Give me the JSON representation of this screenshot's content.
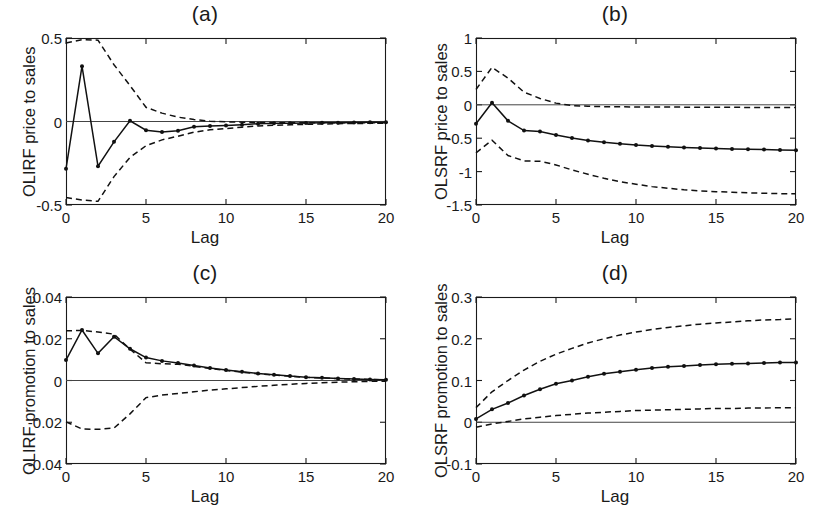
{
  "figure": {
    "panels": [
      {
        "id": "a",
        "title": "(a)",
        "ylabel": "OLIRF price to sales",
        "xlabel": "Lag",
        "yticks": [
          "0.5",
          "0",
          "-0.5"
        ],
        "xticks": [
          "0",
          "5",
          "10",
          "15",
          "20"
        ]
      },
      {
        "id": "b",
        "title": "(b)",
        "ylabel": "OLSRF price to sales",
        "xlabel": "Lag",
        "yticks": [
          "1",
          "0.5",
          "0",
          "-0.5",
          "-1",
          "-1.5"
        ],
        "xticks": [
          "0",
          "5",
          "10",
          "15",
          "20"
        ]
      },
      {
        "id": "c",
        "title": "(c)",
        "ylabel": "OLIRF promotion to sales",
        "xlabel": "Lag",
        "yticks": [
          "0.04",
          "0.02",
          "0",
          "-0.02",
          "-0.04"
        ],
        "xticks": [
          "0",
          "5",
          "10",
          "15",
          "20"
        ]
      },
      {
        "id": "d",
        "title": "(d)",
        "ylabel": "OLSRF promotion to sales",
        "xlabel": "Lag",
        "yticks": [
          "0.3",
          "0.2",
          "0.1",
          "0",
          "-0.1"
        ],
        "xticks": [
          "0",
          "5",
          "10",
          "15",
          "20"
        ]
      }
    ]
  },
  "chart_data": [
    {
      "type": "line",
      "title": "(a)",
      "xlabel": "Lag",
      "ylabel": "OLIRF price to sales",
      "xlim": [
        0,
        20
      ],
      "ylim": [
        -0.5,
        0.5
      ],
      "yticks": [
        -0.5,
        0,
        0.5
      ],
      "xticks": [
        0,
        5,
        10,
        15,
        20
      ],
      "grid": false,
      "legend": "none",
      "zero_line": true,
      "x": [
        0,
        1,
        2,
        3,
        4,
        5,
        6,
        7,
        8,
        9,
        10,
        11,
        12,
        13,
        14,
        15,
        16,
        17,
        18,
        19,
        20
      ],
      "series": [
        {
          "name": "orthogonalized impulse response",
          "style": "solid-with-markers",
          "values": [
            -0.283,
            0.331,
            -0.268,
            -0.122,
            0.004,
            -0.052,
            -0.063,
            -0.055,
            -0.032,
            -0.027,
            -0.024,
            -0.019,
            -0.013,
            -0.011,
            -0.011,
            -0.009,
            -0.008,
            -0.007,
            -0.006,
            -0.005,
            -0.005
          ]
        },
        {
          "name": "upper 95% confidence band",
          "style": "dashed",
          "values": [
            0.47,
            0.49,
            0.487,
            0.34,
            0.215,
            0.085,
            0.05,
            0.026,
            0.012,
            0.002,
            -0.002,
            -0.004,
            -0.006,
            -0.007,
            -0.008,
            -0.008,
            -0.008,
            -0.008,
            -0.008,
            -0.008,
            -0.008
          ]
        },
        {
          "name": "lower 95% confidence band",
          "style": "dashed",
          "values": [
            -0.455,
            -0.47,
            -0.478,
            -0.33,
            -0.215,
            -0.145,
            -0.11,
            -0.088,
            -0.064,
            -0.05,
            -0.042,
            -0.034,
            -0.027,
            -0.023,
            -0.02,
            -0.017,
            -0.015,
            -0.013,
            -0.012,
            -0.011,
            -0.01
          ]
        }
      ]
    },
    {
      "type": "line",
      "title": "(b)",
      "xlabel": "Lag",
      "ylabel": "OLSRF price to sales",
      "xlim": [
        0,
        20
      ],
      "ylim": [
        -1.5,
        1.0
      ],
      "yticks": [
        -1.5,
        -1,
        -0.5,
        0,
        0.5,
        1
      ],
      "xticks": [
        0,
        5,
        10,
        15,
        20
      ],
      "grid": false,
      "legend": "none",
      "zero_line": true,
      "x": [
        0,
        1,
        2,
        3,
        4,
        5,
        6,
        7,
        8,
        9,
        10,
        11,
        12,
        13,
        14,
        15,
        16,
        17,
        18,
        19,
        20
      ],
      "series": [
        {
          "name": "orthogonalized cumulative response",
          "style": "solid-with-markers",
          "values": [
            -0.283,
            0.03,
            -0.24,
            -0.385,
            -0.4,
            -0.452,
            -0.498,
            -0.534,
            -0.562,
            -0.582,
            -0.602,
            -0.615,
            -0.628,
            -0.64,
            -0.648,
            -0.655,
            -0.661,
            -0.666,
            -0.671,
            -0.675,
            -0.68
          ]
        },
        {
          "name": "upper 95% confidence band",
          "style": "dashed",
          "values": [
            0.23,
            0.56,
            0.4,
            0.19,
            0.095,
            0.025,
            -0.012,
            -0.022,
            -0.028,
            -0.03,
            -0.032,
            -0.033,
            -0.034,
            -0.035,
            -0.036,
            -0.037,
            -0.038,
            -0.039,
            -0.04,
            -0.041,
            -0.042
          ]
        },
        {
          "name": "lower 95% confidence band",
          "style": "dashed",
          "values": [
            -0.72,
            -0.53,
            -0.76,
            -0.84,
            -0.845,
            -0.9,
            -0.975,
            -1.04,
            -1.1,
            -1.15,
            -1.19,
            -1.225,
            -1.25,
            -1.272,
            -1.288,
            -1.3,
            -1.31,
            -1.318,
            -1.324,
            -1.33,
            -1.333
          ]
        }
      ]
    },
    {
      "type": "line",
      "title": "(c)",
      "xlabel": "Lag",
      "ylabel": "OLIRF promotion to sales",
      "xlim": [
        0,
        20
      ],
      "ylim": [
        -0.04,
        0.04
      ],
      "yticks": [
        -0.04,
        -0.02,
        0,
        0.02,
        0.04
      ],
      "xticks": [
        0,
        5,
        10,
        15,
        20
      ],
      "grid": false,
      "legend": "none",
      "zero_line": true,
      "x": [
        0,
        1,
        2,
        3,
        4,
        5,
        6,
        7,
        8,
        9,
        10,
        11,
        12,
        13,
        14,
        15,
        16,
        17,
        18,
        19,
        20
      ],
      "series": [
        {
          "name": "orthogonalized impulse response",
          "style": "solid-with-markers",
          "values": [
            0.0098,
            0.0242,
            0.013,
            0.021,
            0.0152,
            0.011,
            0.0094,
            0.0084,
            0.0072,
            0.006,
            0.005,
            0.0042,
            0.0034,
            0.0027,
            0.0021,
            0.0016,
            0.0013,
            0.001,
            0.0007,
            0.0005,
            0.0003
          ]
        },
        {
          "name": "upper 95% confidence band",
          "style": "dashed",
          "values": [
            0.0238,
            0.024,
            0.0232,
            0.0222,
            0.015,
            0.0085,
            0.008,
            0.0078,
            0.0068,
            0.0057,
            0.0048,
            0.004,
            0.0032,
            0.0026,
            0.002,
            0.0015,
            0.0012,
            0.0009,
            0.0007,
            0.0005,
            0.0003
          ]
        },
        {
          "name": "lower 95% confidence band",
          "style": "dashed",
          "values": [
            -0.0198,
            -0.0232,
            -0.0234,
            -0.0228,
            -0.016,
            -0.0082,
            -0.007,
            -0.0062,
            -0.0054,
            -0.0046,
            -0.004,
            -0.0034,
            -0.0028,
            -0.0023,
            -0.0018,
            -0.0014,
            -0.0011,
            -0.0008,
            -0.0006,
            -0.0004,
            -0.0003
          ]
        }
      ]
    },
    {
      "type": "line",
      "title": "(d)",
      "xlabel": "Lag",
      "ylabel": "OLSRF promotion to sales",
      "xlim": [
        0,
        20
      ],
      "ylim": [
        -0.1,
        0.3
      ],
      "yticks": [
        -0.1,
        0,
        0.1,
        0.2,
        0.3
      ],
      "xticks": [
        0,
        5,
        10,
        15,
        20
      ],
      "grid": false,
      "legend": "none",
      "zero_line": true,
      "x": [
        0,
        1,
        2,
        3,
        4,
        5,
        6,
        7,
        8,
        9,
        10,
        11,
        12,
        13,
        14,
        15,
        16,
        17,
        18,
        19,
        20
      ],
      "series": [
        {
          "name": "orthogonalized cumulative response",
          "style": "solid-with-markers",
          "values": [
            0.008,
            0.031,
            0.046,
            0.064,
            0.079,
            0.092,
            0.1,
            0.109,
            0.116,
            0.121,
            0.126,
            0.13,
            0.133,
            0.135,
            0.137,
            0.139,
            0.14,
            0.141,
            0.142,
            0.143,
            0.143
          ]
        },
        {
          "name": "upper 95% confidence band",
          "style": "dashed",
          "values": [
            0.035,
            0.073,
            0.1,
            0.125,
            0.146,
            0.163,
            0.177,
            0.19,
            0.2,
            0.209,
            0.216,
            0.222,
            0.227,
            0.231,
            0.235,
            0.238,
            0.24,
            0.243,
            0.245,
            0.246,
            0.248
          ]
        },
        {
          "name": "lower 95% confidence band",
          "style": "dashed",
          "values": [
            -0.012,
            -0.004,
            0.002,
            0.008,
            0.012,
            0.016,
            0.019,
            0.022,
            0.024,
            0.026,
            0.028,
            0.029,
            0.03,
            0.031,
            0.032,
            0.033,
            0.033,
            0.034,
            0.034,
            0.035,
            0.035
          ]
        }
      ]
    }
  ]
}
